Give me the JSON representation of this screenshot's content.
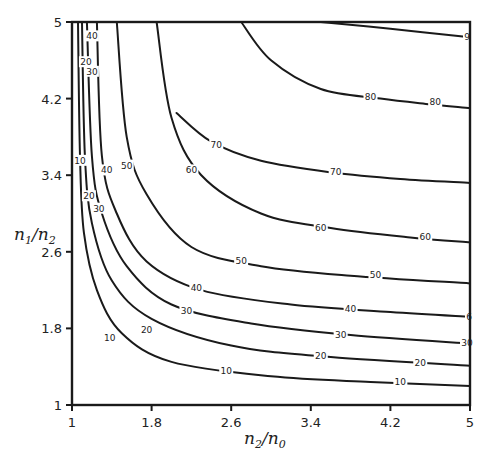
{
  "chart_data": {
    "type": "contour",
    "title": "",
    "xlabel": "n2/n0",
    "ylabel": "n1/n2",
    "xlim": [
      1,
      5
    ],
    "ylim": [
      1,
      5
    ],
    "x_ticks": [
      "1",
      "1.8",
      "2.6",
      "3.4",
      "4.2",
      "5"
    ],
    "y_ticks": [
      "1",
      "1.8",
      "2.6",
      "3.4",
      "4.2",
      "5"
    ],
    "grid": false,
    "levels": [
      10,
      20,
      30,
      40,
      50,
      60,
      70,
      80,
      90
    ],
    "contours": [
      {
        "level": 10,
        "points": [
          [
            1.06,
            5.0
          ],
          [
            1.08,
            3.6
          ],
          [
            1.12,
            2.8
          ],
          [
            1.25,
            2.2
          ],
          [
            1.5,
            1.75
          ],
          [
            2.0,
            1.45
          ],
          [
            3.0,
            1.3
          ],
          [
            4.0,
            1.24
          ],
          [
            5.0,
            1.2
          ]
        ]
      },
      {
        "level": 20,
        "points": [
          [
            1.1,
            5.0
          ],
          [
            1.13,
            3.6
          ],
          [
            1.2,
            2.9
          ],
          [
            1.4,
            2.3
          ],
          [
            1.8,
            1.9
          ],
          [
            2.6,
            1.62
          ],
          [
            3.6,
            1.5
          ],
          [
            5.0,
            1.41
          ]
        ]
      },
      {
        "level": 30,
        "points": [
          [
            1.15,
            5.0
          ],
          [
            1.2,
            3.6
          ],
          [
            1.3,
            3.0
          ],
          [
            1.55,
            2.45
          ],
          [
            2.0,
            2.05
          ],
          [
            2.8,
            1.85
          ],
          [
            3.8,
            1.73
          ],
          [
            5.0,
            1.64
          ]
        ]
      },
      {
        "level": 40,
        "points": [
          [
            1.25,
            5.0
          ],
          [
            1.3,
            3.6
          ],
          [
            1.45,
            3.0
          ],
          [
            1.75,
            2.5
          ],
          [
            2.3,
            2.2
          ],
          [
            3.2,
            2.05
          ],
          [
            4.2,
            1.97
          ],
          [
            5.0,
            1.92
          ]
        ]
      },
      {
        "level": 50,
        "points": [
          [
            1.45,
            5.0
          ],
          [
            1.55,
            3.8
          ],
          [
            1.75,
            3.2
          ],
          [
            2.2,
            2.65
          ],
          [
            2.9,
            2.45
          ],
          [
            3.8,
            2.35
          ],
          [
            5.0,
            2.27
          ]
        ]
      },
      {
        "level": 60,
        "points": [
          [
            1.85,
            5.0
          ],
          [
            2.0,
            4.0
          ],
          [
            2.3,
            3.4
          ],
          [
            2.9,
            3.0
          ],
          [
            3.6,
            2.85
          ],
          [
            4.4,
            2.75
          ],
          [
            5.0,
            2.7
          ]
        ]
      },
      {
        "level": 70,
        "points": [
          [
            2.05,
            4.05
          ],
          [
            2.4,
            3.75
          ],
          [
            2.9,
            3.55
          ],
          [
            3.6,
            3.43
          ],
          [
            4.3,
            3.36
          ],
          [
            5.0,
            3.32
          ]
        ]
      },
      {
        "level": 80,
        "points": [
          [
            2.7,
            5.0
          ],
          [
            3.0,
            4.6
          ],
          [
            3.5,
            4.3
          ],
          [
            4.1,
            4.2
          ],
          [
            4.6,
            4.14
          ],
          [
            5.0,
            4.1
          ]
        ]
      },
      {
        "level": 90,
        "points": [
          [
            3.5,
            5.0
          ],
          [
            4.2,
            4.93
          ],
          [
            5.0,
            4.84
          ]
        ]
      }
    ],
    "labels": [
      {
        "text": "40",
        "x": 1.2,
        "y": 4.85
      },
      {
        "text": "20",
        "x": 1.14,
        "y": 4.58
      },
      {
        "text": "30",
        "x": 1.2,
        "y": 4.48
      },
      {
        "text": "10",
        "x": 1.08,
        "y": 3.55
      },
      {
        "text": "40",
        "x": 1.35,
        "y": 3.45
      },
      {
        "text": "50",
        "x": 1.55,
        "y": 3.5
      },
      {
        "text": "60",
        "x": 2.2,
        "y": 3.45
      },
      {
        "text": "20",
        "x": 1.17,
        "y": 3.18
      },
      {
        "text": "30",
        "x": 1.27,
        "y": 3.05
      },
      {
        "text": "70",
        "x": 2.45,
        "y": 3.72
      },
      {
        "text": "80",
        "x": 4.0,
        "y": 4.22
      },
      {
        "text": "80",
        "x": 4.65,
        "y": 4.16
      },
      {
        "text": "70",
        "x": 3.65,
        "y": 3.43
      },
      {
        "text": "60",
        "x": 3.5,
        "y": 2.85
      },
      {
        "text": "60",
        "x": 4.55,
        "y": 2.75
      },
      {
        "text": "50",
        "x": 2.7,
        "y": 2.5
      },
      {
        "text": "50",
        "x": 4.05,
        "y": 2.36
      },
      {
        "text": "40",
        "x": 2.25,
        "y": 2.22
      },
      {
        "text": "40",
        "x": 3.8,
        "y": 2.0
      },
      {
        "text": "30",
        "x": 2.15,
        "y": 1.98
      },
      {
        "text": "30",
        "x": 3.7,
        "y": 1.73
      },
      {
        "text": "30",
        "x": 4.97,
        "y": 1.65
      },
      {
        "text": "20",
        "x": 1.75,
        "y": 1.78
      },
      {
        "text": "20",
        "x": 3.5,
        "y": 1.51
      },
      {
        "text": "20",
        "x": 4.5,
        "y": 1.44
      },
      {
        "text": "10",
        "x": 1.38,
        "y": 1.7
      },
      {
        "text": "10",
        "x": 2.55,
        "y": 1.36
      },
      {
        "text": "10",
        "x": 4.3,
        "y": 1.24
      },
      {
        "text": "9",
        "x": 4.97,
        "y": 4.84
      },
      {
        "text": "6",
        "x": 4.99,
        "y": 1.92
      }
    ]
  }
}
